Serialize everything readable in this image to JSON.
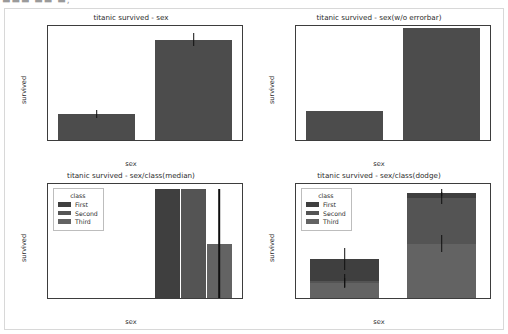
{
  "top_strip_text": "▬▬▬ ▬▬ ▬,",
  "figure": {
    "background": "#ffffff",
    "border_color": "#d8d8d8"
  },
  "palette": {
    "single_bar": "#4c4c4c",
    "first": "#3f3f3f",
    "second": "#545454",
    "third": "#636363",
    "error": "#101010",
    "axis": "#3d3d3d",
    "text": "#2b2b2b"
  },
  "chart_data": [
    {
      "id": "titanic-survived-sex",
      "type": "bar",
      "title": "titanic survived - sex",
      "xlabel": "sex",
      "ylabel": "survived",
      "categories": [
        "male",
        "female"
      ],
      "values": [
        0.19,
        0.74
      ],
      "errors": [
        0.03,
        0.05
      ],
      "yticks": [
        0.0,
        0.2,
        0.4,
        0.6,
        0.8
      ],
      "ytick_labels": [
        "0.0",
        "0.2",
        "0.4",
        "0.6",
        "0.8"
      ],
      "ylim": [
        0.0,
        0.84
      ],
      "grid": false,
      "legend": null,
      "errorbars": true
    },
    {
      "id": "titanic-survived-sex-no-errorbar",
      "type": "bar",
      "title": "titanic survived - sex(w/o errorbar)",
      "xlabel": "sex",
      "ylabel": "survived",
      "categories": [
        "male",
        "female"
      ],
      "values": [
        0.19,
        0.74
      ],
      "errors": [
        0.0,
        0.0
      ],
      "yticks": [
        0.0,
        0.1,
        0.2,
        0.3,
        0.4,
        0.5,
        0.6,
        0.7
      ],
      "ytick_labels": [
        "0.0",
        "0.1",
        "0.2",
        "0.3",
        "0.4",
        "0.5",
        "0.6",
        "0.7"
      ],
      "ylim": [
        0.0,
        0.755
      ],
      "grid": false,
      "legend": null,
      "errorbars": false
    },
    {
      "id": "titanic-survived-sex-class-median",
      "type": "bar",
      "title": "titanic survived - sex/class(median)",
      "xlabel": "sex",
      "ylabel": "survived",
      "categories": [
        "male",
        "female"
      ],
      "yticks": [
        0.0,
        0.2,
        0.4,
        0.6,
        0.8,
        1.0
      ],
      "ytick_labels": [
        "0.0",
        "0.2",
        "0.4",
        "0.6",
        "0.8",
        "1.0"
      ],
      "ylim": [
        0.0,
        1.05
      ],
      "grid": false,
      "errorbars": true,
      "legend": {
        "title": "class",
        "position": "upper left",
        "entries": [
          "First",
          "Second",
          "Third"
        ]
      },
      "series": [
        {
          "name": "First",
          "values": [
            0.0,
            1.0
          ],
          "errors": [
            0.0,
            0.0
          ]
        },
        {
          "name": "Second",
          "values": [
            0.0,
            1.0
          ],
          "errors": [
            0.0,
            0.0
          ]
        },
        {
          "name": "Third",
          "values": [
            0.0,
            0.5
          ],
          "errors": [
            0.0,
            0.5
          ]
        }
      ]
    },
    {
      "id": "titanic-survived-sex-class-dodge",
      "type": "bar",
      "title": "titanic survived - sex/class(dodge)",
      "xlabel": "sex",
      "ylabel": "survived",
      "categories": [
        "male",
        "female"
      ],
      "yticks": [
        0.0,
        0.2,
        0.4,
        0.6,
        0.8,
        1.0
      ],
      "ytick_labels": [
        "0.0",
        "0.2",
        "0.4",
        "0.6",
        "0.8",
        "1.0"
      ],
      "ylim": [
        0.0,
        1.05
      ],
      "grid": false,
      "errorbars": true,
      "legend": {
        "title": "class",
        "position": "upper left",
        "entries": [
          "First",
          "Second",
          "Third"
        ]
      },
      "series": [
        {
          "name": "First",
          "values": [
            0.357,
            0.968
          ],
          "errors": [
            0.1,
            0.032
          ]
        },
        {
          "name": "Second",
          "values": [
            0.157,
            0.921
          ],
          "errors": [
            0.06,
            0.055
          ]
        },
        {
          "name": "Third",
          "values": [
            0.135,
            0.5
          ],
          "errors": [
            0.045,
            0.08
          ]
        }
      ]
    }
  ]
}
